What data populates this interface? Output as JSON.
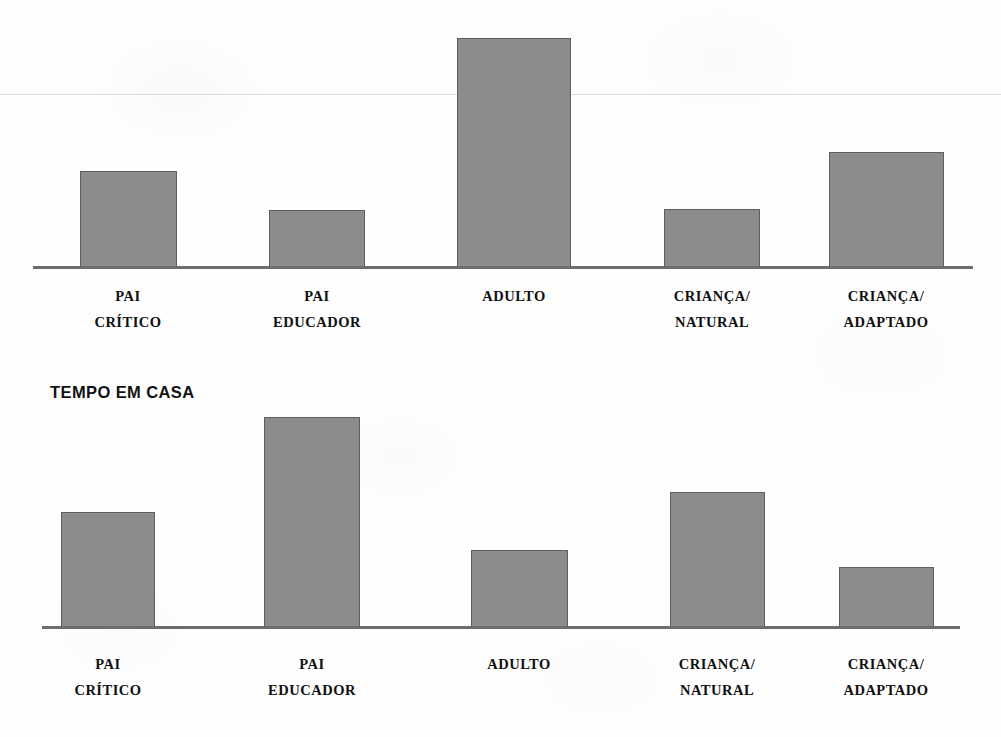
{
  "page": {
    "width": 1001,
    "height": 737,
    "background_color": "#ffffff",
    "bar_fill_color": "#8c8c8c",
    "bar_border_color": "#5e5e5e",
    "axis_color": "#6d6d6d",
    "gridline_color": "#dcdcdc",
    "text_color": "#101010"
  },
  "charts": [
    {
      "id": "chart-top",
      "title": "",
      "has_title": false,
      "categories": [
        "PAI\nCRÍTICO",
        "PAI\nEDUCADOR",
        "ADULTO",
        "CRIANÇA/\nNATURAL",
        "CRIANÇA/\nADAPTADO"
      ],
      "category_lines": [
        [
          "PAI",
          "CRÍTICO"
        ],
        [
          "PAI",
          "EDUCADOR"
        ],
        [
          "ADULTO",
          ""
        ],
        [
          "CRIANÇA/",
          "NATURAL"
        ],
        [
          "CRIANÇA/",
          "ADAPTADO"
        ]
      ],
      "values": [
        42,
        25,
        100,
        25,
        50
      ],
      "geometry": {
        "baseline_y": 266,
        "axis_left": 33,
        "axis_right": 973,
        "label_line1_y": 283,
        "label_line2_y": 309,
        "gridline_y": 94,
        "bars": [
          {
            "left": 80,
            "width": 97,
            "top": 171
          },
          {
            "left": 269,
            "width": 96,
            "top": 210
          },
          {
            "left": 457,
            "width": 114,
            "top": 38
          },
          {
            "left": 664,
            "width": 96,
            "top": 209
          },
          {
            "left": 829,
            "width": 115,
            "top": 152
          }
        ],
        "label_centers": [
          128,
          317,
          514,
          712,
          886
        ]
      }
    },
    {
      "id": "chart-bottom",
      "title": "TEMPO EM CASA",
      "has_title": true,
      "title_x": 50,
      "title_y": 383,
      "categories": [
        "PAI\nCRÍTICO",
        "PAI\nEDUCADOR",
        "ADULTO",
        "CRIANÇA/\nNATURAL",
        "CRIANÇA/\nADAPTADO"
      ],
      "category_lines": [
        [
          "PAI",
          "CRÍTICO"
        ],
        [
          "PAI",
          "EDUCADOR"
        ],
        [
          "ADULTO",
          ""
        ],
        [
          "CRIANÇA/",
          "NATURAL"
        ],
        [
          "CRIANÇA/",
          "ADAPTADO"
        ]
      ],
      "values": [
        55,
        100,
        36,
        64,
        28
      ],
      "geometry": {
        "baseline_y": 626,
        "axis_left": 42,
        "axis_right": 960,
        "label_line1_y": 651,
        "label_line2_y": 679,
        "bars": [
          {
            "left": 61,
            "width": 94,
            "top": 512
          },
          {
            "left": 264,
            "width": 96,
            "top": 417
          },
          {
            "left": 471,
            "width": 97,
            "top": 550
          },
          {
            "left": 670,
            "width": 95,
            "top": 492
          },
          {
            "left": 839,
            "width": 95,
            "top": 567
          }
        ],
        "label_centers": [
          108,
          312,
          519,
          717,
          886
        ]
      }
    }
  ],
  "chart_data": [
    {
      "type": "bar",
      "title": "",
      "xlabel": "",
      "ylabel": "",
      "categories": [
        "PAI CRÍTICO",
        "PAI EDUCADOR",
        "ADULTO",
        "CRIANÇA/NATURAL",
        "CRIANÇA/ADAPTADO"
      ],
      "values": [
        42,
        25,
        100,
        25,
        50
      ],
      "ylim": [
        0,
        100
      ],
      "grid": true,
      "legend": "none",
      "note": "Heights read as percentage of the tallest bar (ADULTO). Axis is unlabelled; no numeric ticks shown."
    },
    {
      "type": "bar",
      "title": "TEMPO EM CASA",
      "xlabel": "",
      "ylabel": "",
      "categories": [
        "PAI CRÍTICO",
        "PAI EDUCADOR",
        "ADULTO",
        "CRIANÇA/NATURAL",
        "CRIANÇA/ADAPTADO"
      ],
      "values": [
        55,
        100,
        36,
        64,
        28
      ],
      "ylim": [
        0,
        100
      ],
      "grid": false,
      "legend": "none",
      "note": "Heights read as percentage of the tallest bar (PAI EDUCADOR). Axis is unlabelled; no numeric ticks shown."
    }
  ]
}
